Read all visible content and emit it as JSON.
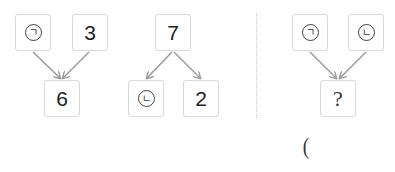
{
  "diagrams": [
    {
      "name": "compose-left",
      "top": [
        {
          "value": "㉠",
          "circled": true
        },
        {
          "value": "3",
          "circled": false
        }
      ],
      "bottom": [
        {
          "value": "6",
          "circled": false
        }
      ]
    },
    {
      "name": "decompose-middle",
      "top": [
        {
          "value": "7",
          "circled": false
        }
      ],
      "bottom": [
        {
          "value": "㉡",
          "circled": true
        },
        {
          "value": "2",
          "circled": false
        }
      ]
    },
    {
      "name": "compose-right",
      "top": [
        {
          "value": "㉠",
          "circled": true
        },
        {
          "value": "㉡",
          "circled": true
        }
      ],
      "bottom": [
        {
          "value": "?",
          "circled": false
        }
      ]
    }
  ],
  "labels": {
    "g": "ㄱ",
    "n": "ㄴ",
    "answer_paren": "("
  },
  "colors": {
    "box_border": "#d9d9d9",
    "arrow": "#9a9a9a",
    "divider": "#c8c8c8"
  }
}
